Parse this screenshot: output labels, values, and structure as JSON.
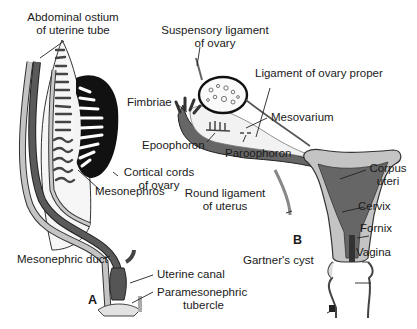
{
  "figure": {
    "panels": [
      {
        "id": "A",
        "label": "A"
      },
      {
        "id": "B",
        "label": "B"
      }
    ],
    "colors": {
      "dark_duct": "#555555",
      "light_duct": "#c4c4c4",
      "ovary_cortex": "#111111",
      "background": "#ffffff",
      "text": "#1a1a1a"
    }
  },
  "labels_a": {
    "abdominal_ostium_1": "Abdominal ostium",
    "abdominal_ostium_2": "of uterine tube",
    "cortical_cords_1": "Cortical cords",
    "cortical_cords_2": "of ovary",
    "mesonephros": "Mesonephros",
    "mesonephric_duct": "Mesonephric duct",
    "uterine_canal": "Uterine canal",
    "paramesonephric_tubercle_1": "Paramesonephric",
    "paramesonephric_tubercle_2": "tubercle"
  },
  "labels_b": {
    "suspensory_ligament_1": "Suspensory ligament",
    "suspensory_ligament_2": "of ovary",
    "ligament_ovary_proper": "Ligament of ovary proper",
    "fimbriae": "Fimbriae",
    "mesovarium": "Mesovarium",
    "epoophoron": "Epoophoron",
    "paroophoron": "Paroophoron",
    "round_ligament_1": "Round ligament",
    "round_ligament_2": "of uterus",
    "corpus_uteri_1": "Corpus",
    "corpus_uteri_2": "uteri",
    "cervix": "Cervix",
    "fornix": "Fornix",
    "vagina": "Vagina",
    "gartners_cyst": "Gartner's cyst"
  }
}
